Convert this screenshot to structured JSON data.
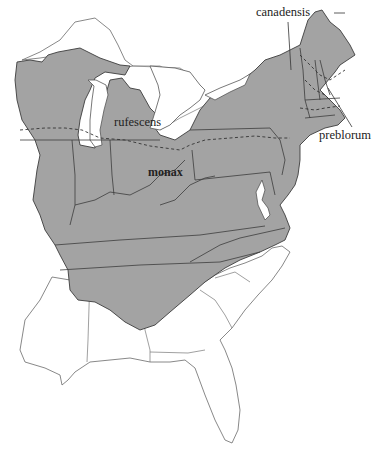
{
  "map": {
    "title": "",
    "range_color": "#a3a3a3",
    "outline_color": "#3c3c3c",
    "labels": [
      {
        "id": "canadensis",
        "text": "canadensis",
        "x": 256,
        "y": 6,
        "bold": false
      },
      {
        "id": "rufescens",
        "text": "rufescens",
        "x": 114,
        "y": 116,
        "bold": false
      },
      {
        "id": "monax",
        "text": "monax",
        "x": 148,
        "y": 166,
        "bold": true
      },
      {
        "id": "preblorum",
        "text": "preblorum",
        "x": 319,
        "y": 129,
        "bold": false
      }
    ]
  }
}
